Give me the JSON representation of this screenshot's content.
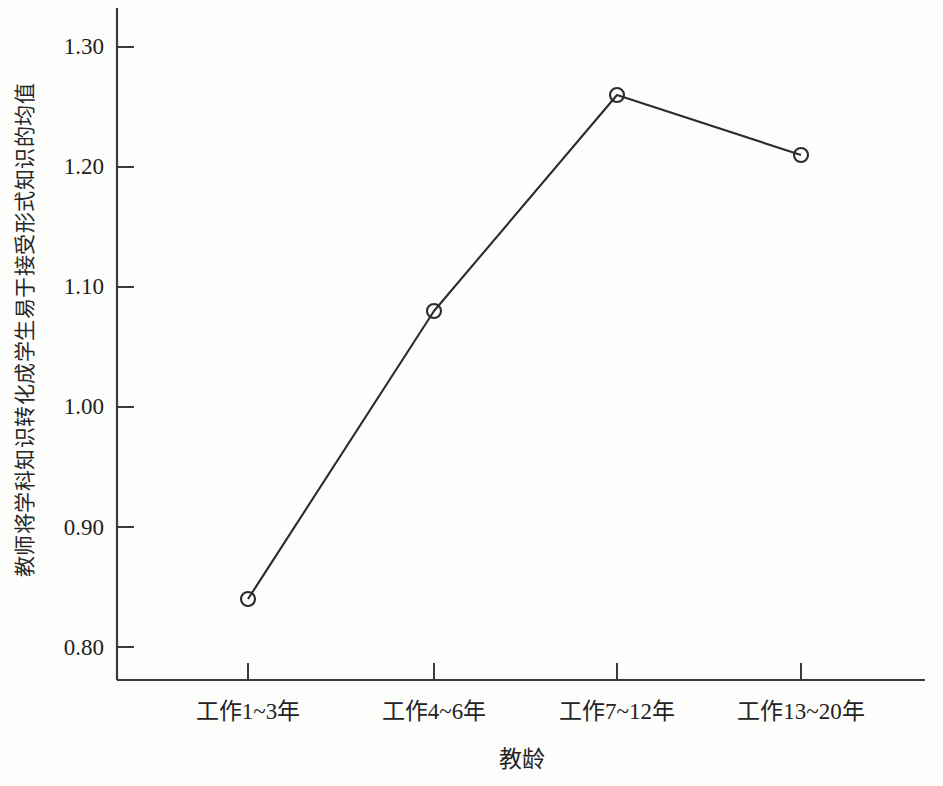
{
  "chart_data": {
    "type": "line",
    "title": "",
    "xlabel": "教龄",
    "ylabel": "教师将学科知识转化成学生易于接受形式知识的均值",
    "categories": [
      "工作1~3年",
      "工作4~6年",
      "工作7~12年",
      "工作13~20年"
    ],
    "values": [
      0.84,
      1.08,
      1.26,
      1.21
    ],
    "series": [
      {
        "name": "教师将学科知识转化成学生易于接受形式知识的均值",
        "values": [
          0.84,
          1.08,
          1.26,
          1.21
        ]
      }
    ],
    "ylim": [
      0.78,
      1.335
    ],
    "yticks": [
      0.8,
      0.9,
      1.0,
      1.1,
      1.2,
      1.3
    ],
    "ytick_labels": [
      "0.80",
      "0.90",
      "1.00",
      "1.10",
      "1.20",
      "1.30"
    ],
    "grid": false,
    "legend": false,
    "legend_position": "none",
    "marker": "open-circle",
    "line_color": "#2b2b2b",
    "marker_color": "#2b2b2b",
    "axis_color": "#3a3a3a",
    "background_color": "#fdfdfc"
  },
  "axes": {
    "y_title": "教师将学科知识转化成学生易于接受形式知识的均值",
    "x_title": "教龄",
    "y_ticks": [
      {
        "label": "1.30",
        "value": 1.3
      },
      {
        "label": "1.20",
        "value": 1.2
      },
      {
        "label": "1.10",
        "value": 1.1
      },
      {
        "label": "1.00",
        "value": 1.0
      },
      {
        "label": "0.90",
        "value": 0.9
      },
      {
        "label": "0.80",
        "value": 0.8
      }
    ],
    "x_ticks": [
      {
        "label": "工作1~3年"
      },
      {
        "label": "工作4~6年"
      },
      {
        "label": "工作7~12年"
      },
      {
        "label": "工作13~20年"
      }
    ]
  }
}
